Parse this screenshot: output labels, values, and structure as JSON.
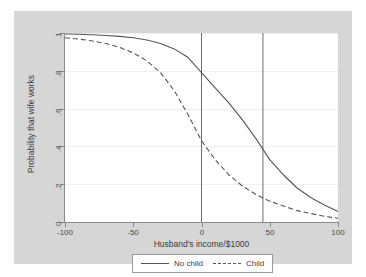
{
  "chart_data": {
    "type": "line",
    "title": "",
    "xlabel": "Husband's income/$1000",
    "ylabel": "Probability that wife works",
    "xlim": [
      -100,
      100
    ],
    "ylim": [
      0,
      1
    ],
    "xticks": [
      "-100",
      "-50",
      "0",
      "50",
      "100"
    ],
    "xtick_values": [
      -100,
      -50,
      0,
      50,
      100
    ],
    "yticks": [
      "0",
      ".2",
      ".4",
      ".6",
      ".8",
      "1"
    ],
    "ytick_values": [
      0,
      0.2,
      0.4,
      0.6,
      0.8,
      1
    ],
    "grid": true,
    "legend_position": "below",
    "legend": [
      "No child",
      "Child"
    ],
    "reference_lines": [
      {
        "orientation": "vertical",
        "x": 0
      },
      {
        "orientation": "vertical",
        "x": 45
      }
    ],
    "series": [
      {
        "name": "No child",
        "style": "solid",
        "color": "#555555",
        "x": [
          -100,
          -90,
          -80,
          -70,
          -60,
          -50,
          -40,
          -30,
          -20,
          -10,
          0,
          10,
          20,
          30,
          40,
          50,
          60,
          70,
          80,
          90,
          100
        ],
        "values": [
          0.995,
          0.993,
          0.991,
          0.987,
          0.982,
          0.975,
          0.963,
          0.945,
          0.916,
          0.872,
          0.79,
          0.71,
          0.63,
          0.54,
          0.44,
          0.33,
          0.25,
          0.18,
          0.13,
          0.09,
          0.055
        ]
      },
      {
        "name": "Child",
        "style": "dashed",
        "color": "#555555",
        "x": [
          -100,
          -90,
          -80,
          -70,
          -60,
          -50,
          -40,
          -30,
          -20,
          -10,
          0,
          10,
          20,
          30,
          40,
          50,
          60,
          70,
          80,
          90,
          100
        ],
        "values": [
          0.975,
          0.968,
          0.958,
          0.944,
          0.924,
          0.895,
          0.852,
          0.79,
          0.695,
          0.57,
          0.43,
          0.33,
          0.25,
          0.19,
          0.145,
          0.11,
          0.085,
          0.06,
          0.045,
          0.03,
          0.02
        ]
      }
    ]
  },
  "legend": {
    "entries": [
      {
        "label": "No child",
        "style": "solid"
      },
      {
        "label": "Child",
        "style": "dashed"
      }
    ]
  },
  "axes": {
    "x_title": "Husband's income/$1000",
    "y_title": "Probability that wife works"
  }
}
